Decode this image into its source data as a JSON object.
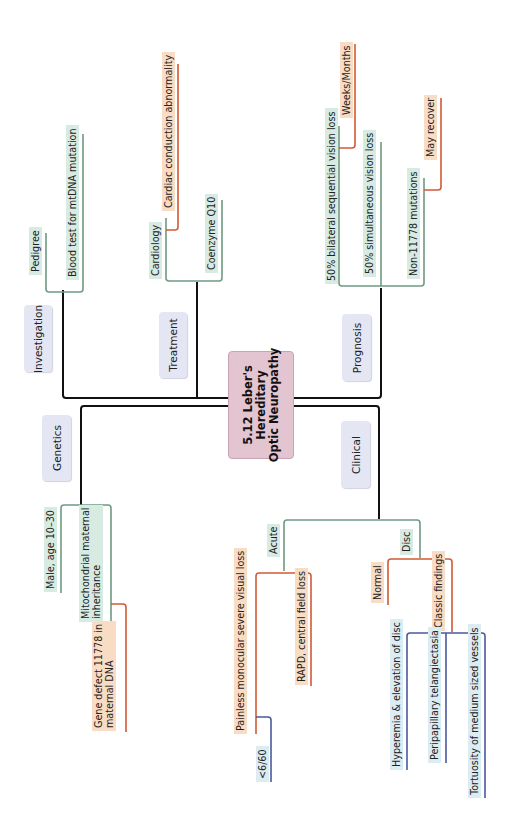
{
  "title": "5.12 Leber's Hereditary Optic Neuropathy",
  "title_lines": [
    "5.12 Leber's",
    "Hereditary",
    "Optic Neuropathy"
  ],
  "colors": {
    "trunk": "#111111",
    "level1": "#6e9a82",
    "level2": "#d25a34",
    "level3": "#4a5a9c",
    "center_fill": "#e3c5d1",
    "category_fill": "#e4e7f3",
    "green_label": "#d8ebe3",
    "orange_label": "#f9dcc4",
    "blue_label": "#dcecf3"
  },
  "categories": {
    "investigation": "Investigation",
    "treatment": "Treatment",
    "prognosis": "Prognosis",
    "genetics": "Genetics",
    "clinical": "Clinical"
  },
  "investigation": {
    "items": [
      "Pedigree",
      "Blood test for mtDNA mutation"
    ]
  },
  "treatment": {
    "cardiology": "Cardiology",
    "cardiology_sub": "Cardiac conduction abnormality",
    "coenzyme": "Coenzyme Q10"
  },
  "prognosis": {
    "bilateral": "50% bilateral sequential vision loss",
    "bilateral_sub": "Weeks/Months",
    "simultaneous": "50% simultaneous vision loss",
    "non11778": "Non-11778 mutations",
    "non11778_sub": "May recover"
  },
  "genetics": {
    "male": "Male, age 10–30",
    "mito_line1": "Mitochondrial maternal",
    "mito_line2": "inheritance",
    "gene_line1": "Gene defect 11778 in",
    "gene_line2": "maternal DNA"
  },
  "clinical": {
    "acute": "Acute",
    "painless": "Painless monocular severe visual loss",
    "va": "<6/60",
    "rapd": "RAPD, central field loss",
    "disc": "Disc",
    "normal": "Normal",
    "classic": "Classic findings",
    "classic_items": [
      "Hyperemia & elevation of disc",
      "Peripapillary telangiectasia",
      "Tortuosity of medium sized vessels"
    ]
  }
}
